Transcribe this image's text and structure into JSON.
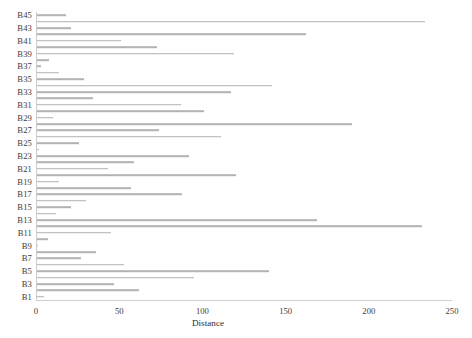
{
  "chart_data": {
    "type": "bar",
    "orientation": "horizontal",
    "title": "",
    "subtitle": "",
    "xlabel": "Distance",
    "ylabel": "",
    "xlim": [
      0,
      250
    ],
    "ylim_categories": 45,
    "grid": false,
    "legend": null,
    "bar_color": "#b2b2b2",
    "axis_color": "#cccccc",
    "text_color": "#3a3a3a",
    "x_ticks": [
      0,
      50,
      100,
      150,
      200,
      250
    ],
    "x_tick_labels": [
      "0",
      "50",
      "100",
      "150",
      "200",
      "250"
    ],
    "y_tick_labels": [
      "B45",
      "B43",
      "B41",
      "B39",
      "B37",
      "B35",
      "B33",
      "B31",
      "B29",
      "B27",
      "B25",
      "B23",
      "B21",
      "B19",
      "B17",
      "B15",
      "B13",
      "B11",
      "B9",
      "B7",
      "B5",
      "B3",
      "B1"
    ],
    "categories": [
      "B45",
      "B44",
      "B43",
      "B42",
      "B41",
      "B40",
      "B39",
      "B38",
      "B37",
      "B36",
      "B35",
      "B34",
      "B33",
      "B32",
      "B31",
      "B30",
      "B29",
      "B28",
      "B27",
      "B26",
      "B25",
      "B24",
      "B23",
      "B22",
      "B21",
      "B20",
      "B19",
      "B18",
      "B17",
      "B16",
      "B15",
      "B14",
      "B13",
      "B12",
      "B11",
      "B10",
      "B9",
      "B8",
      "B7",
      "B6",
      "B5",
      "B4",
      "B3",
      "B2",
      "B1"
    ],
    "values": [
      18,
      234,
      21,
      162,
      51,
      73,
      119,
      8,
      3,
      14,
      29,
      142,
      117,
      34,
      87,
      101,
      10,
      190,
      74,
      111,
      26,
      2,
      92,
      59,
      43,
      120,
      14,
      57,
      88,
      30,
      21,
      12,
      169,
      232,
      45,
      7,
      1,
      36,
      27,
      53,
      140,
      95,
      47,
      62,
      5
    ]
  }
}
